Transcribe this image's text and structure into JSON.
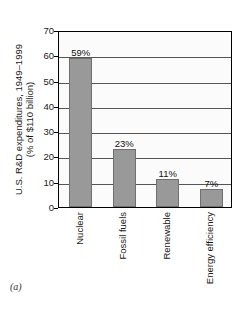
{
  "figure": {
    "caption": "(a)"
  },
  "chart_data": {
    "type": "bar",
    "title": "",
    "xlabel": "",
    "ylabel": "U.S. R&D expenditures, 1949–1999 (% of $110 billion)",
    "ylabel_lines": [
      "U.S. R&D expenditures, 1949–1999",
      "(% of $110 billion)"
    ],
    "categories": [
      "Nuclear",
      "Fossil fuels",
      "Renewable",
      "Energy efficiency"
    ],
    "values": [
      59,
      23,
      11,
      7
    ],
    "data_labels": [
      "59%",
      "23%",
      "11%",
      "7%"
    ],
    "ylim": [
      0,
      70
    ],
    "yticks": [
      0,
      10,
      20,
      30,
      40,
      50,
      60,
      70
    ],
    "ytick_labels": [
      "0",
      "10",
      "20",
      "30",
      "40",
      "50",
      "60",
      "70"
    ],
    "grid": true,
    "grid_axis": "y",
    "legend": false,
    "bar_color": "#999999",
    "bar_edge_color": "#6f6f6f",
    "plot_background": "#fbfbfb",
    "frame_color": "#000000",
    "gridline_color": "#555555"
  }
}
